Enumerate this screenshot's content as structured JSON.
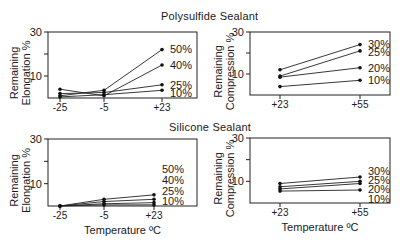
{
  "figure": {
    "sections": [
      {
        "title": "Polysulfide Sealant"
      },
      {
        "title": "Silicone Sealant"
      }
    ],
    "xlabel": "Temperature ºC"
  },
  "chart_data": [
    {
      "type": "line",
      "title": "Polysulfide Sealant",
      "ylabel": "Remaining Elongation %",
      "xlabel": "",
      "categories": [
        "-25",
        "-5",
        "+23"
      ],
      "ylim": [
        0,
        30
      ],
      "yticks": [
        10,
        30
      ],
      "grid": false,
      "legend_position": "inline-right",
      "series": [
        {
          "name": "50%",
          "values": [
            1.0,
            3.5,
            22
          ]
        },
        {
          "name": "40%",
          "values": [
            4.0,
            1.0,
            15
          ]
        },
        {
          "name": "25%",
          "values": [
            2.0,
            2.5,
            6
          ]
        },
        {
          "name": "10%",
          "values": [
            0.5,
            1.5,
            3.5
          ]
        }
      ]
    },
    {
      "type": "line",
      "title": "Polysulfide Sealant",
      "ylabel": "Remaining Compression %",
      "xlabel": "",
      "categories": [
        "+23",
        "+55"
      ],
      "ylim": [
        0,
        30
      ],
      "yticks": [
        10,
        30
      ],
      "grid": false,
      "legend_position": "inline-right",
      "series": [
        {
          "name": "30%",
          "values": [
            12,
            24
          ]
        },
        {
          "name": "25%",
          "values": [
            9,
            21
          ]
        },
        {
          "name": "20%",
          "values": [
            8.5,
            13
          ]
        },
        {
          "name": "10%",
          "values": [
            4,
            7
          ]
        }
      ]
    },
    {
      "type": "line",
      "title": "Silicone Sealant",
      "ylabel": "Remaining Elongation %",
      "xlabel": "Temperature ºC",
      "categories": [
        "-25",
        "-5",
        "+23"
      ],
      "ylim": [
        0,
        30
      ],
      "yticks": [
        10,
        30
      ],
      "grid": false,
      "legend_position": "inline-right",
      "series": [
        {
          "name": "50%",
          "values": [
            0,
            3,
            5
          ]
        },
        {
          "name": "40%",
          "values": [
            0,
            2,
            3
          ]
        },
        {
          "name": "25%",
          "values": [
            0,
            1,
            1.5
          ]
        },
        {
          "name": "10%",
          "values": [
            0,
            0.5,
            0.5
          ]
        }
      ]
    },
    {
      "type": "line",
      "title": "Silicone Sealant",
      "ylabel": "Remaining Compression %",
      "xlabel": "Temperature ºC",
      "categories": [
        "+23",
        "+55"
      ],
      "ylim": [
        0,
        30
      ],
      "yticks": [
        10,
        30
      ],
      "grid": false,
      "legend_position": "inline-right",
      "series": [
        {
          "name": "30%",
          "values": [
            9,
            12
          ]
        },
        {
          "name": "25%",
          "values": [
            7.5,
            10
          ]
        },
        {
          "name": "20%",
          "values": [
            6.5,
            9
          ]
        },
        {
          "name": "10%",
          "values": [
            5.5,
            6
          ]
        }
      ]
    }
  ]
}
